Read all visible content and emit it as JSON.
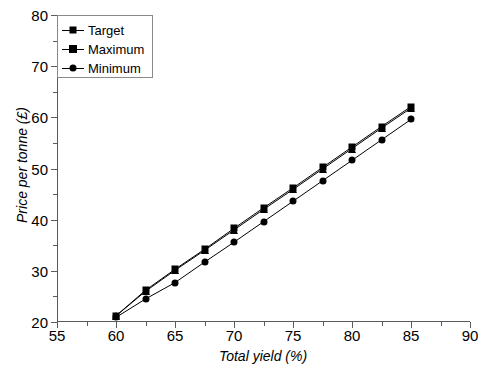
{
  "chart_data": {
    "type": "line",
    "title": "",
    "xlabel": "Total yield (%)",
    "ylabel": "Price per tonne (£)",
    "xlim": [
      55,
      90
    ],
    "ylim": [
      20,
      80
    ],
    "x_major_ticks": [
      55,
      60,
      65,
      70,
      75,
      80,
      85,
      90
    ],
    "x_minor_ticks": [
      57.5,
      62.5,
      67.5,
      72.5,
      77.5,
      82.5,
      87.5
    ],
    "y_major_ticks": [
      20,
      30,
      40,
      50,
      60,
      70,
      80
    ],
    "y_minor_ticks": [
      25,
      35,
      45,
      55,
      65,
      75
    ],
    "grid": false,
    "legend_position": "upper left",
    "x": [
      60,
      62.5,
      65,
      67.5,
      70,
      72.5,
      75,
      77.5,
      80,
      82.5,
      85
    ],
    "series": [
      {
        "name": "Target",
        "marker": "square",
        "color": "#000000",
        "values": [
          21.2,
          26.2,
          30.3,
          34.2,
          38.3,
          42.3,
          46.2,
          50.2,
          54.2,
          58.2,
          62.1
        ]
      },
      {
        "name": "Maximum",
        "marker": "triangle",
        "color": "#000000",
        "values": [
          21.2,
          26.0,
          30.1,
          34.0,
          38.0,
          42.0,
          45.9,
          49.9,
          53.9,
          57.9,
          61.8
        ]
      },
      {
        "name": "Minimum",
        "marker": "circle",
        "color": "#000000",
        "values": [
          20.9,
          24.5,
          27.7,
          31.7,
          35.6,
          39.6,
          43.6,
          47.6,
          51.6,
          55.6,
          59.6
        ]
      }
    ]
  },
  "legend": {
    "items": [
      {
        "label": "Target"
      },
      {
        "label": "Maximum"
      },
      {
        "label": "Minimum"
      }
    ]
  }
}
